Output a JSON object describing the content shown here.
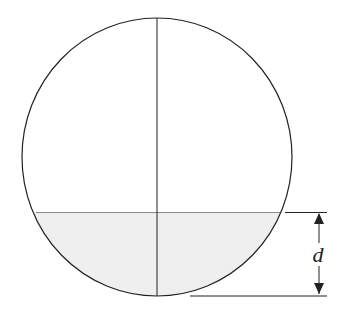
{
  "figure": {
    "colors": {
      "outline": "#222222",
      "fill_region": "#efefef",
      "chord": "#8a8a8a",
      "dimension": "#222222",
      "background": "#ffffff"
    },
    "circle": {
      "cx": 157,
      "cy": 157,
      "rx": 135,
      "ry": 139
    },
    "vertical_diameter": {
      "x": 157,
      "y1": 18,
      "y2": 296
    },
    "water_line": {
      "y": 212.5
    },
    "dimension": {
      "label": "d",
      "top_extension": {
        "x1": 285,
        "x2": 327,
        "y": 212.5
      },
      "bottom_extension": {
        "x1": 190,
        "x2": 327,
        "y": 296
      },
      "arrow_x": 319,
      "label_x": 318,
      "label_y": 262
    }
  }
}
